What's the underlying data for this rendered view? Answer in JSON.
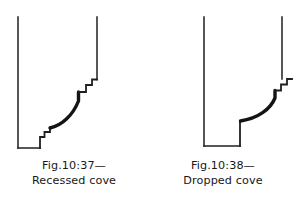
{
  "page": {
    "background_color": "#ffffff",
    "ink_color": "#1a1a1a",
    "width": 297,
    "height": 203
  },
  "figures": [
    {
      "id": "fig-10-37",
      "name": "recessed-cove",
      "caption_line1": "Fig.10:37—",
      "caption_line2": "Recessed cove",
      "description": "Sectional profile drawing of a recessed cove moulding",
      "outline_path": "M 18 9 L 18 140 L 40 140 L 40 130 L 44 130 L 44 125 L 49 125 L 49 120 L 55 118 C 66 114 76 104 80 92 L 80 83 L 86 83 L 86 76 L 92 76 L 92 71 L 97 71 L 97 9",
      "cove_curve_path": "M 49 121 C 62 118 74 106 79 92 L 79 84",
      "stroke_thin": 1.4,
      "stroke_thick": 3.2
    },
    {
      "id": "fig-10-38",
      "name": "dropped-cove",
      "caption_line1": "Fig.10:38—",
      "caption_line2": "Dropped cove",
      "description": "Sectional profile drawing of a dropped cove moulding",
      "outline_path": "M 55 9 L 55 138 L 91 138 L 91 113 L 97 113 C 112 111 124 101 128 90 L 128 82 L 133 82 L 133 77 L 133 71 L 133 9",
      "cove_curve_path": "M 92 113 C 110 110 123 100 127 89 L 127 82",
      "stroke_thin": 1.4,
      "stroke_thick": 3.2
    }
  ]
}
